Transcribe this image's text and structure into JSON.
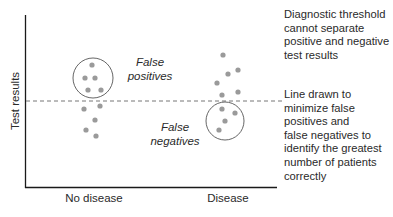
{
  "diagram": {
    "y_axis_label": "Test results",
    "x_categories": [
      "No disease",
      "Disease"
    ],
    "annotations": {
      "false_positives": [
        "False",
        "positives"
      ],
      "false_negatives": [
        "False",
        "negatives"
      ]
    },
    "notes": {
      "threshold_problem": "Diagnostic threshold\ncannot separate\npositive and negative\ntest results",
      "threshold_line": "Line drawn to\nminimize false\npositives and\nfalse negatives to\nidentify the greatest\nnumber of patients\ncorrectly"
    },
    "colors": {
      "dot": "#9a9a9a",
      "axis": "#1a1a1a",
      "threshold": "#777777",
      "circle": "#555555"
    },
    "threshold_line": {
      "style": "dashed",
      "y": 101
    },
    "groups": [
      {
        "name": "No disease",
        "dots_above_threshold": [
          [
            92,
            65
          ],
          [
            85,
            78
          ],
          [
            95,
            78
          ],
          [
            88,
            90
          ],
          [
            101,
            90
          ]
        ],
        "dots_below_threshold": [
          [
            84,
            109
          ],
          [
            100,
            106
          ],
          [
            95,
            120
          ],
          [
            86,
            130
          ],
          [
            96,
            136
          ]
        ],
        "circled": "false positives"
      },
      {
        "name": "Disease",
        "dots_above_threshold": [
          [
            223,
            55
          ],
          [
            238,
            70
          ],
          [
            228,
            74
          ],
          [
            217,
            83
          ],
          [
            222,
            95
          ],
          [
            238,
            92
          ]
        ],
        "dots_below_threshold": [
          [
            222,
            109
          ],
          [
            235,
            113
          ],
          [
            225,
            121
          ],
          [
            219,
            130
          ]
        ],
        "circled": "false negatives"
      }
    ]
  }
}
